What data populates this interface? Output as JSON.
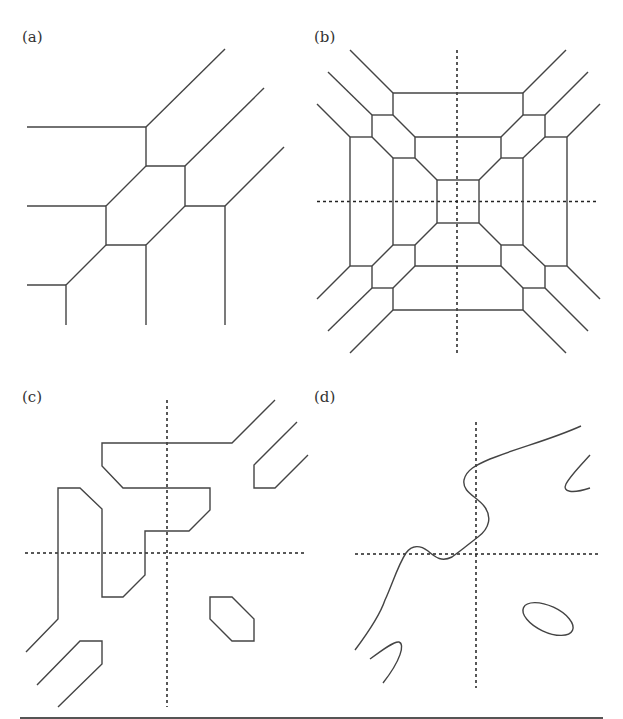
{
  "figure": {
    "panels": [
      {
        "id": "a",
        "label": "(a)",
        "label_pos": [
          22,
          30
        ],
        "has_axes": false
      },
      {
        "id": "b",
        "label": "(b)",
        "label_pos": [
          314,
          30
        ],
        "has_axes": true
      },
      {
        "id": "c",
        "label": "(c)",
        "label_pos": [
          22,
          390
        ],
        "has_axes": true
      },
      {
        "id": "d",
        "label": "(d)",
        "label_pos": [
          314,
          390
        ],
        "has_axes": true
      }
    ],
    "colors": {
      "line": "#444444",
      "axis": "#222222",
      "rule": "#555555",
      "background": "#ffffff"
    }
  }
}
